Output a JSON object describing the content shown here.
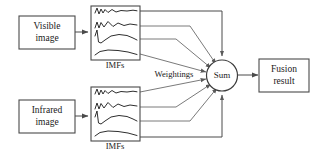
{
  "diagram": {
    "colors": {
      "background": "#ffffff",
      "box_stroke": "#4a4a4a",
      "wire": "#6b6b6b",
      "curve": "#2e2e2e",
      "text": "#1a1a1a"
    },
    "nodes": {
      "visible_image": {
        "label_line1": "Visible",
        "label_line2": "image"
      },
      "infrared_image": {
        "label_line1": "Infrared",
        "label_line2": "image"
      },
      "imfs_top": {
        "caption": "IMFs"
      },
      "imfs_bottom": {
        "caption": "IMFs"
      },
      "weightings": {
        "label": "Weightings"
      },
      "sum": {
        "label": "Sum"
      },
      "fusion_result": {
        "label_line1": "Fusion",
        "label_line2": "result"
      }
    },
    "imf_signal_count": 4
  }
}
